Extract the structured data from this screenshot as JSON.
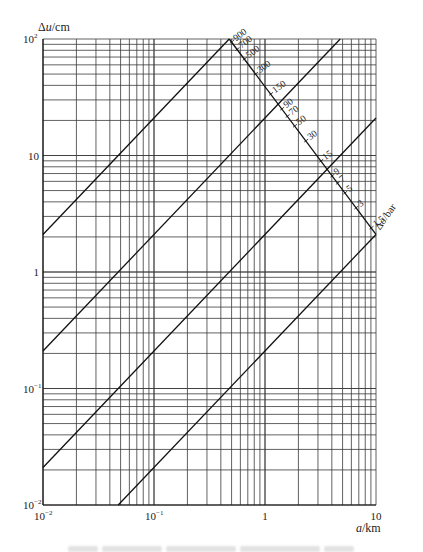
{
  "chart_data": {
    "type": "line",
    "title": "",
    "xlabel": "a/km",
    "ylabel": "Δu/cm",
    "xscale": "log",
    "yscale": "log",
    "xlim": [
      0.01,
      10
    ],
    "ylim": [
      0.01,
      100
    ],
    "grid": true,
    "x_tick_labels": [
      {
        "value": 0.01,
        "base": "10",
        "exp": "-2"
      },
      {
        "value": 0.1,
        "base": "10",
        "exp": "-1"
      },
      {
        "value": 1,
        "base": "1",
        "exp": ""
      },
      {
        "value": 10,
        "base": "10",
        "exp": ""
      }
    ],
    "y_tick_labels": [
      {
        "value": 100,
        "base": "10",
        "exp": "2"
      },
      {
        "value": 10,
        "base": "10",
        "exp": ""
      },
      {
        "value": 1,
        "base": "1",
        "exp": ""
      },
      {
        "value": 0.1,
        "base": "10",
        "exp": "-1"
      },
      {
        "value": 0.01,
        "base": "10",
        "exp": "-2"
      }
    ],
    "series": [
      {
        "name": "line-1",
        "relation": "Δu = 210·a",
        "points": [
          [
            0.01,
            2.1
          ],
          [
            0.476,
            100
          ]
        ]
      },
      {
        "name": "line-2",
        "relation": "Δu = 21·a",
        "points": [
          [
            0.01,
            0.21
          ],
          [
            4.76,
            100
          ]
        ]
      },
      {
        "name": "line-3",
        "relation": "Δu = 2.1·a",
        "points": [
          [
            0.01,
            0.021
          ],
          [
            10,
            21
          ]
        ]
      },
      {
        "name": "line-4",
        "relation": "Δu = 0.21·a",
        "points": [
          [
            0.0476,
            0.01
          ],
          [
            10,
            2.1
          ]
        ]
      }
    ],
    "secondary_scale": {
      "label": "Δσ/bar",
      "start": [
        0.476,
        100
      ],
      "end": [
        10,
        2.1
      ],
      "ticks": [
        900,
        700,
        500,
        300,
        150,
        90,
        70,
        50,
        30,
        15,
        9,
        7,
        5,
        3,
        1.5
      ],
      "range": [
        1000,
        1.2
      ]
    }
  },
  "labels": {
    "ylabel_delta": "Δ",
    "ylabel_var": "u",
    "ylabel_unit": "/cm",
    "xlabel_var": "a",
    "xlabel_unit": "/km",
    "sigma_label": "Δσ/bar"
  },
  "colors": {
    "grid": "#3a3a3a",
    "line": "#111111",
    "text": "#222222"
  }
}
